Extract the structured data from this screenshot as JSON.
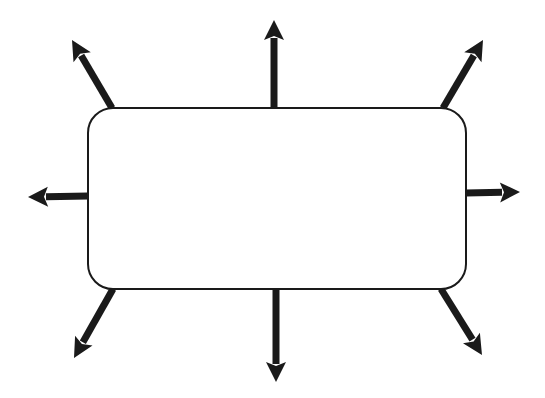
{
  "diagram": {
    "type": "brainstorm-web",
    "background": "#ffffff",
    "stroke_color": "#1a1a1a",
    "center_box": {
      "label": "",
      "x": 88,
      "y": 108,
      "width": 378,
      "height": 181,
      "radius": 25,
      "fill": "#ffffff",
      "stroke_width": 2
    },
    "arrows": [
      {
        "id": "arrow-top-left",
        "direction": "up-left",
        "x1": 112,
        "y1": 108,
        "x2": 72,
        "y2": 40
      },
      {
        "id": "arrow-top",
        "direction": "up",
        "x1": 274,
        "y1": 108,
        "x2": 274,
        "y2": 20
      },
      {
        "id": "arrow-top-right",
        "direction": "up-right",
        "x1": 443,
        "y1": 108,
        "x2": 483,
        "y2": 40
      },
      {
        "id": "arrow-left",
        "direction": "left",
        "x1": 88,
        "y1": 196,
        "x2": 28,
        "y2": 197
      },
      {
        "id": "arrow-right",
        "direction": "right",
        "x1": 466,
        "y1": 193,
        "x2": 520,
        "y2": 192
      },
      {
        "id": "arrow-bottom-left",
        "direction": "down-left",
        "x1": 113,
        "y1": 289,
        "x2": 74,
        "y2": 358
      },
      {
        "id": "arrow-bottom",
        "direction": "down",
        "x1": 276,
        "y1": 289,
        "x2": 276,
        "y2": 382
      },
      {
        "id": "arrow-bottom-right",
        "direction": "down-right",
        "x1": 441,
        "y1": 289,
        "x2": 482,
        "y2": 355
      }
    ],
    "arrow_shaft_width": 7,
    "arrow_head_length": 20,
    "arrow_head_width": 20
  }
}
